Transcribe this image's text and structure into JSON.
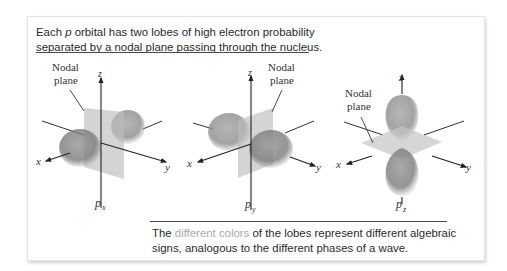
{
  "top_caption": {
    "line1_pre": "Each ",
    "line1_italic": "p",
    "line1_post": " orbital has two lobes of high electron probability",
    "line2": "separated by a nodal plane passing through the nucleus."
  },
  "bottom_caption": {
    "line1_pre": "The ",
    "line1_highlight": "different colors",
    "line1_post": " of the lobes represent different algebraic",
    "line2": "signs, analogous to the different phases of a wave."
  },
  "orbitals": [
    {
      "id": "px",
      "label_main": "p",
      "label_sub": "x",
      "nodal_label_line1": "Nodal",
      "nodal_label_line2": "plane",
      "x_axis": "x",
      "y_axis": "y",
      "z_axis": "z"
    },
    {
      "id": "py",
      "label_main": "p",
      "label_sub": "y",
      "nodal_label_line1": "Nodal",
      "nodal_label_line2": "plane",
      "x_axis": "x",
      "y_axis": "y",
      "z_axis": "z"
    },
    {
      "id": "pz",
      "label_main": "p",
      "label_sub": "z",
      "nodal_label_line1": "Nodal",
      "nodal_label_line2": "plane",
      "x_axis": "x",
      "y_axis": "y",
      "z_axis": "z"
    }
  ],
  "colors": {
    "highlight_text": "#a8a8a8",
    "lobe": "#8a8a8a",
    "plane": "#c8c8c8",
    "axis": "#333333"
  }
}
